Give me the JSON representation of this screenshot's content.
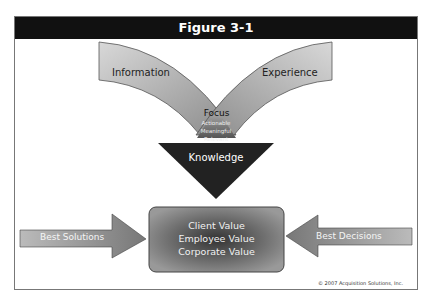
{
  "figure": {
    "title": "Figure 3-1",
    "inputs": {
      "left": "Information",
      "right": "Experience"
    },
    "focus": {
      "label": "Focus",
      "qualities": [
        "Actionable",
        "Meaningful",
        "Relevant"
      ]
    },
    "knowledge": "Knowledge",
    "center_box": [
      "Client Value",
      "Employee Value",
      "Corporate Value"
    ],
    "side_arrows": {
      "left": "Best Solutions",
      "right": "Best Decisions"
    },
    "copyright": "© 2007 Acquisition Solutions, Inc."
  }
}
